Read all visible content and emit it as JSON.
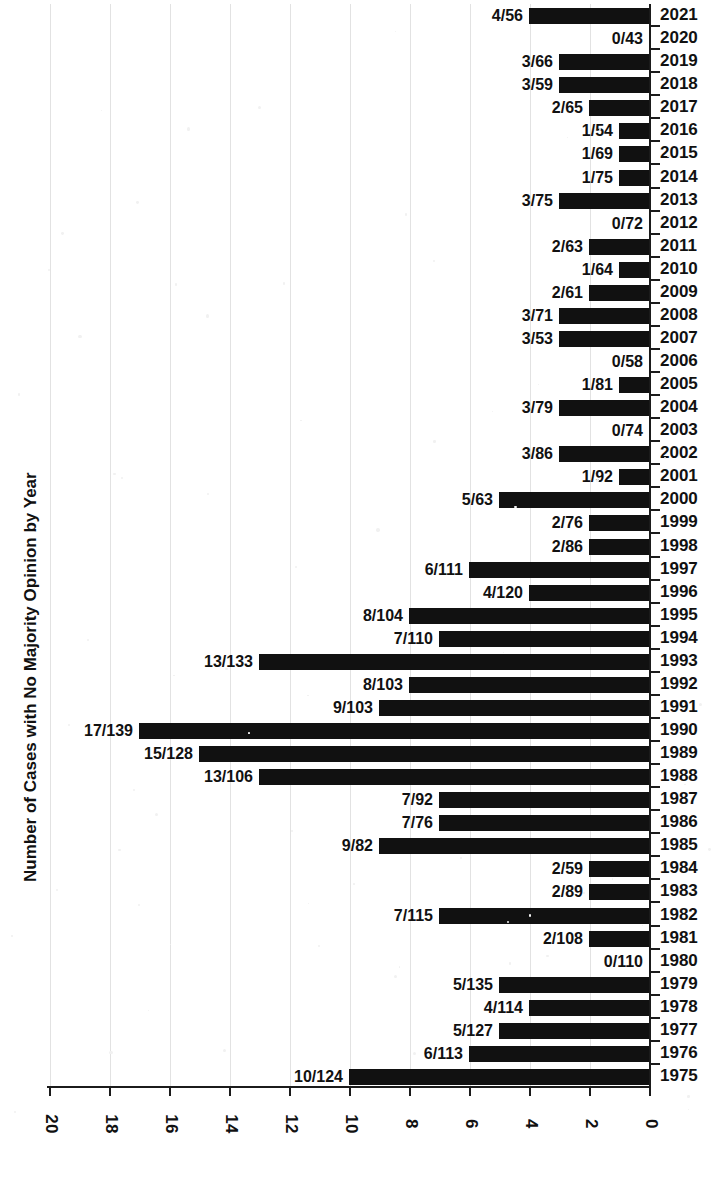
{
  "chart_data": {
    "type": "bar",
    "orientation": "horizontal",
    "title": "Number of Cases with No Majority Opinion by Year",
    "axis_title": "Number of Cases with No Majority Opinion by Year",
    "xlabel": "",
    "ylabel": "",
    "xlim": [
      0,
      20
    ],
    "xticks": [
      0,
      2,
      4,
      6,
      8,
      10,
      12,
      14,
      16,
      18,
      20
    ],
    "xtick_labels": [
      "0",
      "2",
      "4",
      "6",
      "8",
      "10",
      "12",
      "14",
      "16",
      "18",
      "20"
    ],
    "grid": true,
    "grid_axis": "x",
    "legend": false,
    "bar_color": "#111111",
    "categories": [
      "2021",
      "2020",
      "2019",
      "2018",
      "2017",
      "2016",
      "2015",
      "2014",
      "2013",
      "2012",
      "2011",
      "2010",
      "2009",
      "2008",
      "2007",
      "2006",
      "2005",
      "2004",
      "2003",
      "2002",
      "2001",
      "2000",
      "1999",
      "1998",
      "1997",
      "1996",
      "1995",
      "1994",
      "1993",
      "1992",
      "1991",
      "1990",
      "1989",
      "1988",
      "1987",
      "1986",
      "1985",
      "1984",
      "1983",
      "1982",
      "1981",
      "1980",
      "1979",
      "1978",
      "1977",
      "1976",
      "1975"
    ],
    "values": [
      4,
      0,
      3,
      3,
      2,
      1,
      1,
      1,
      3,
      0,
      2,
      1,
      2,
      3,
      3,
      0,
      1,
      3,
      0,
      3,
      1,
      5,
      2,
      2,
      6,
      4,
      8,
      7,
      13,
      8,
      9,
      17,
      15,
      13,
      7,
      7,
      9,
      2,
      2,
      7,
      2,
      0,
      5,
      4,
      5,
      6,
      10
    ],
    "totals": [
      56,
      43,
      66,
      59,
      65,
      54,
      69,
      75,
      75,
      72,
      63,
      64,
      61,
      71,
      53,
      58,
      81,
      79,
      74,
      86,
      92,
      63,
      76,
      86,
      111,
      120,
      104,
      110,
      133,
      103,
      103,
      139,
      128,
      106,
      92,
      76,
      82,
      59,
      89,
      115,
      108,
      110,
      135,
      114,
      127,
      113,
      124
    ],
    "data_labels": [
      "4/56",
      "0/43",
      "3/66",
      "3/59",
      "2/65",
      "1/54",
      "1/69",
      "1/75",
      "3/75",
      "0/72",
      "2/63",
      "1/64",
      "2/61",
      "3/71",
      "3/53",
      "0/58",
      "1/81",
      "3/79",
      "0/74",
      "3/86",
      "1/92",
      "5/63",
      "2/76",
      "2/86",
      "6/111",
      "4/120",
      "8/104",
      "7/110",
      "13/133",
      "8/103",
      "9/103",
      "17/139",
      "15/128",
      "13/106",
      "7/92",
      "7/76",
      "9/82",
      "2/59",
      "2/89",
      "7/115",
      "2/108",
      "0/110",
      "5/135",
      "4/114",
      "5/127",
      "6/113",
      "10/124"
    ]
  }
}
